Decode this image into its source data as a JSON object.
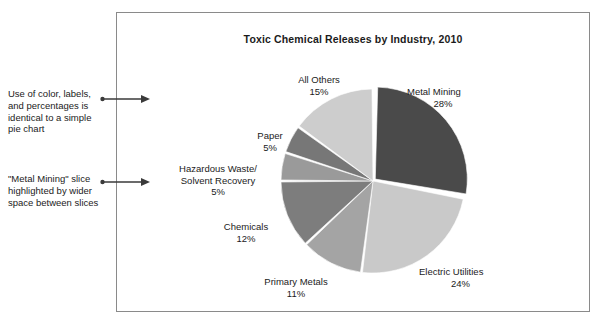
{
  "figure": {
    "background_color": "#ffffff",
    "frame_border_color": "#8a8a8a",
    "text_color": "#1b1b1b"
  },
  "annotations": [
    {
      "id": "annotation-color-labels",
      "text": "Use of color, labels, and percentages is identical to a simple pie chart",
      "arrow": "arrow-right-icon"
    },
    {
      "id": "annotation-metal-mining-highlight",
      "text": "\"Metal Mining\" slice highlighted by wider space between slices",
      "arrow": "arrow-right-icon"
    }
  ],
  "chart_data": {
    "type": "pie",
    "title": "Toxic Chemical Releases by Industry, 2010",
    "subtitle": "",
    "xlabel": "",
    "ylabel": "",
    "grid": false,
    "legend_position": "none",
    "label_format": "name above percent",
    "exploded_slice": "Metal Mining",
    "start_angle_deg": -90,
    "direction": "clockwise",
    "categories": [
      "Metal Mining",
      "Electric Utilities",
      "Primary Metals",
      "Chemicals",
      "Hazardous Waste/ Solvent Recovery",
      "Paper",
      "All Others"
    ],
    "values": [
      28,
      24,
      11,
      12,
      5,
      5,
      15
    ],
    "units": "percent",
    "slices": [
      {
        "name": "Metal Mining",
        "label_line1": "Metal Mining",
        "label_line2": "28%",
        "value": 28,
        "color": "#4a4a4a",
        "exploded": true
      },
      {
        "name": "Electric Utilities",
        "label_line1": "Electric Utilities",
        "label_line2": "24%",
        "value": 24,
        "color": "#c9c9c9",
        "exploded": false
      },
      {
        "name": "Primary Metals",
        "label_line1": "Primary Metals",
        "label_line2": "11%",
        "value": 11,
        "color": "#a4a4a4",
        "exploded": false
      },
      {
        "name": "Chemicals",
        "label_line1": "Chemicals",
        "label_line2": "12%",
        "value": 12,
        "color": "#7d7d7d",
        "exploded": false
      },
      {
        "name": "Hazardous Waste/ Solvent Recovery",
        "label_line1": "Hazardous Waste/",
        "label_line2": "Solvent Recovery",
        "label_line3": "5%",
        "value": 5,
        "color": "#9a9a9a",
        "exploded": false
      },
      {
        "name": "Paper",
        "label_line1": "Paper",
        "label_line2": "5%",
        "value": 5,
        "color": "#777777",
        "exploded": false
      },
      {
        "name": "All Others",
        "label_line1": "All Others",
        "label_line2": "15%",
        "value": 15,
        "color": "#cdcdcd",
        "exploded": false
      }
    ]
  }
}
